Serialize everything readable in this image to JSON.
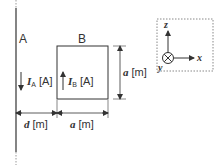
{
  "figure": {
    "wire_label": "A",
    "loop_label": "B",
    "current_a": {
      "symbol": "I",
      "subscript": "A",
      "unit": "[A]",
      "direction": "down"
    },
    "current_b": {
      "symbol": "I",
      "subscript": "B",
      "unit": "[A]",
      "direction": "up"
    },
    "side_dimension": {
      "symbol": "a",
      "unit": "[m]"
    },
    "distance_dimension": {
      "symbol": "d",
      "unit": "[m]"
    },
    "width_dimension": {
      "symbol": "a",
      "unit": "[m]"
    },
    "axes": {
      "z_label": "z",
      "x_label": "x",
      "y_label": "y",
      "y_direction": "into-page"
    },
    "colors": {
      "line": "#333333",
      "dashed": "#888888"
    }
  }
}
